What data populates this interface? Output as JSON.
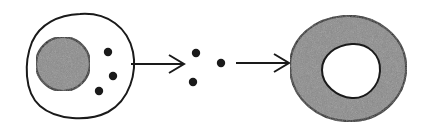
{
  "diagram": {
    "colors": {
      "background": "#ffffff",
      "stroke": "#1a1a1a",
      "nucleus_fill": "#8a8a8a",
      "ring_fill": "#8a8a8a",
      "granule_fill": "#1a1a1a"
    },
    "stages": [
      {
        "id": "source-cell",
        "parts": [
          "cell-membrane",
          "nucleus",
          "granules"
        ],
        "granule_count": 3
      },
      {
        "id": "arrow-1"
      },
      {
        "id": "released-granules",
        "granule_count": 3
      },
      {
        "id": "arrow-2"
      },
      {
        "id": "ring-cell",
        "parts": [
          "outer-ring",
          "inner-hole"
        ]
      }
    ]
  }
}
